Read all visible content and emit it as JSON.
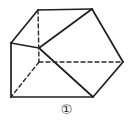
{
  "figure": {
    "caption": "①",
    "caption_plain": "1",
    "caption_style": "circled-number",
    "alt": "Three-dimensional polyhedron (oblique prism) drawn with solid visible edges and dashed hidden edges",
    "colors": {
      "background": "#ffffff",
      "stroke_solid": "#1f1f1f",
      "stroke_dashed": "#2a2a2a",
      "caption_text": "#1a1a1a"
    },
    "stroke": {
      "solid_width": 1.7,
      "dashed_width": 1.4,
      "dash_pattern": "4,3"
    },
    "vertices": {
      "A_top_left": [
        38,
        10
      ],
      "B_top_right": [
        92,
        9
      ],
      "C_left": [
        11,
        43
      ],
      "D_right": [
        123,
        62
      ],
      "E_hidden_center": [
        39,
        62
      ],
      "F_mid_left": [
        39,
        48
      ],
      "G_bottom_left": [
        11,
        97
      ],
      "H_bottom": [
        93,
        97
      ]
    },
    "edges_solid": [
      {
        "name": "top-edge",
        "from": [
          38,
          10
        ],
        "to": [
          92,
          9
        ]
      },
      {
        "name": "upper-left-slant",
        "from": [
          38,
          10
        ],
        "to": [
          11,
          43
        ]
      },
      {
        "name": "left-vertical",
        "from": [
          11,
          43
        ],
        "to": [
          11,
          97
        ]
      },
      {
        "name": "bottom-edge",
        "from": [
          11,
          97
        ],
        "to": [
          93,
          97
        ]
      },
      {
        "name": "lower-right-slant",
        "from": [
          93,
          97
        ],
        "to": [
          123,
          62
        ]
      },
      {
        "name": "upper-right-slant",
        "from": [
          123,
          62
        ],
        "to": [
          92,
          9
        ]
      },
      {
        "name": "left-horizontal-short",
        "from": [
          11,
          43
        ],
        "to": [
          39,
          48
        ]
      },
      {
        "name": "face-diagonal-upper",
        "from": [
          39,
          48
        ],
        "to": [
          92,
          9
        ]
      },
      {
        "name": "face-diagonal-lower",
        "from": [
          39,
          48
        ],
        "to": [
          93,
          97
        ]
      }
    ],
    "edges_dashed": [
      {
        "name": "hidden-vertical",
        "from": [
          38,
          10
        ],
        "to": [
          39,
          62
        ]
      },
      {
        "name": "hidden-horizontal",
        "from": [
          39,
          62
        ],
        "to": [
          123,
          62
        ]
      },
      {
        "name": "hidden-diagonal",
        "from": [
          39,
          62
        ],
        "to": [
          11,
          97
        ]
      }
    ]
  }
}
